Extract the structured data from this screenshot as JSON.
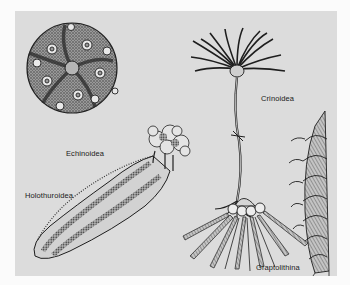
{
  "figure": {
    "background_color": "#fbfbfb",
    "panel_color": "#dcdcdc",
    "ink_color": "#222222",
    "labels": {
      "echinoidea": "Echinoidea",
      "crinoidea": "Crinoidea",
      "holothuroidea": "Holothuroidea",
      "graptolithina": "Graptolithina"
    },
    "specimens": [
      {
        "id": "echinoidea",
        "description": "sea urchin test, globular with five ambulacral bands and tubercles"
      },
      {
        "id": "crinoidea",
        "description": "sea lily with feathery crown on a long stalk and root holdfast"
      },
      {
        "id": "holothuroidea",
        "description": "sea cucumber, elongated body with spotted longitudinal bands and oral tentacles"
      },
      {
        "id": "graptolithina",
        "description": "graptolite colony with float and radiating stipes, plus a spiral rhabdosome"
      }
    ]
  }
}
